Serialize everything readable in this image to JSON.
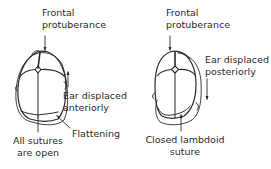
{
  "colors": {
    "line": "#2a2a2a",
    "text": "#2a2a2a",
    "background": "#ffffff"
  },
  "left_skull": {
    "top_label_line1": "Frontal",
    "top_label_line2": "protuberance",
    "side_label_line1": "Ear displaced",
    "side_label_line2": "anteriorly",
    "side_arrow_direction": "up",
    "flattening_label": "Flattening",
    "bottom_label_line1": "All sutures",
    "bottom_label_line2": "are open"
  },
  "right_skull": {
    "top_label_line1": "Frontal",
    "top_label_line2": "protuberance",
    "side_label_line1": "Ear displaced",
    "side_label_line2": "posteriorly",
    "side_arrow_direction": "down",
    "bottom_label_line1": "Closed lambdoid",
    "bottom_label_line2": "suture"
  }
}
